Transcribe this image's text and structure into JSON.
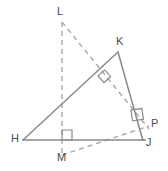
{
  "figure": {
    "width": 168,
    "height": 171,
    "background_color": "#ffffff",
    "solid_line_color": "#8a8a8a",
    "dashed_line_color": "#a8a8a8",
    "marker_color": "#8a8a8a",
    "label_color": "#4a4a4a"
  },
  "points": {
    "H": {
      "label": "H",
      "x": 23,
      "y": 140,
      "label_x": 11,
      "label_y": 133
    },
    "K": {
      "label": "K",
      "x": 118,
      "y": 52,
      "label_x": 116,
      "label_y": 36
    },
    "J": {
      "label": "J",
      "x": 143,
      "y": 140,
      "label_x": 146,
      "label_y": 137
    },
    "L": {
      "label": "L",
      "x": 62,
      "y": 22,
      "label_x": 57,
      "label_y": 6
    },
    "M": {
      "label": "M",
      "x": 62,
      "y": 155,
      "label_x": 57,
      "label_y": 152
    },
    "P": {
      "label": "P",
      "x": 145,
      "y": 125,
      "label_x": 151,
      "label_y": 118
    }
  },
  "segments": [
    {
      "name": "segment-HK",
      "from": "H",
      "to": "K",
      "style": "solid"
    },
    {
      "name": "segment-KJ",
      "from": "K",
      "to": "J",
      "style": "solid"
    },
    {
      "name": "segment-HJ",
      "from": "H",
      "to": "J",
      "style": "solid"
    },
    {
      "name": "segment-LM",
      "from": "L",
      "to": "M",
      "style": "dashed"
    },
    {
      "name": "segment-LP",
      "from": "L",
      "to": "P",
      "style": "dashed"
    },
    {
      "name": "segment-MP",
      "from": "M",
      "to": "P",
      "style": "dashed"
    }
  ],
  "right_angle_markers": [
    {
      "name": "right-angle-at-hk-intersection",
      "x": 98,
      "y": 76,
      "size": 9,
      "rotation": -42
    },
    {
      "name": "right-angle-at-m",
      "x": 66,
      "y": 136,
      "size": 10,
      "rotation": 0
    },
    {
      "name": "right-angle-at-p",
      "x": 136,
      "y": 116,
      "size": 11,
      "rotation": -10
    }
  ]
}
